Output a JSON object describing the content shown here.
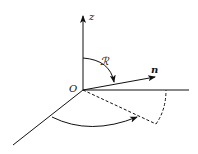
{
  "diagram": {
    "type": "3d-coordinate-angle-diagram",
    "labels": {
      "z_axis": "z",
      "origin": "O",
      "vector": "n",
      "rotation": "ℛ"
    },
    "colors": {
      "stroke": "#111111",
      "background": "#ffffff"
    }
  }
}
